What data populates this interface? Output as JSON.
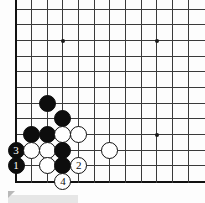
{
  "board": {
    "kind": "go-board",
    "visible_columns": 12,
    "visible_rows": 12,
    "origin_x": 16,
    "origin_y": 9.3,
    "spacing": 15.66,
    "line_color": "#3a3a3a",
    "edge_color": "#111111",
    "background_color": "#fdfdfd",
    "edges": {
      "left": true,
      "bottom": true,
      "top": false,
      "right": false
    },
    "star_points": [
      {
        "col": 3,
        "row": 2
      },
      {
        "col": 9,
        "row": 2
      },
      {
        "col": 9,
        "row": 8
      }
    ],
    "stones": [
      {
        "col": 2,
        "row": 6,
        "color": "black",
        "label": ""
      },
      {
        "col": 3,
        "row": 7,
        "color": "black",
        "label": ""
      },
      {
        "col": 1,
        "row": 8,
        "color": "black",
        "label": ""
      },
      {
        "col": 2,
        "row": 8,
        "color": "black",
        "label": ""
      },
      {
        "col": 3,
        "row": 8,
        "color": "white",
        "label": ""
      },
      {
        "col": 4,
        "row": 8,
        "color": "white",
        "label": ""
      },
      {
        "col": 0,
        "row": 9,
        "color": "black",
        "label": "3"
      },
      {
        "col": 1,
        "row": 9,
        "color": "white",
        "label": ""
      },
      {
        "col": 2,
        "row": 9,
        "color": "white",
        "label": ""
      },
      {
        "col": 3,
        "row": 9,
        "color": "black",
        "label": ""
      },
      {
        "col": 6,
        "row": 9,
        "color": "white",
        "label": ""
      },
      {
        "col": 0,
        "row": 10,
        "color": "black",
        "label": "1"
      },
      {
        "col": 2,
        "row": 10,
        "color": "white",
        "label": ""
      },
      {
        "col": 3,
        "row": 10,
        "color": "black",
        "label": ""
      },
      {
        "col": 4,
        "row": 10,
        "color": "white",
        "label": "2"
      },
      {
        "col": 3,
        "row": 11,
        "color": "white",
        "label": "4"
      }
    ],
    "move_labels": [
      "1",
      "2",
      "3",
      "4"
    ]
  },
  "artifact": {
    "strip_color": "#e6e6e6",
    "handle_color": "#b9b9b9"
  }
}
